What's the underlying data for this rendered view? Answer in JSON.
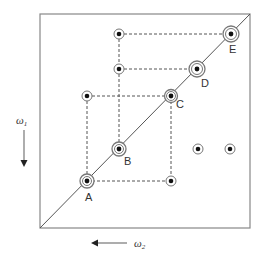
{
  "diagram": {
    "type": "2D spectrum correlation map",
    "frame": {
      "x1": 40,
      "y1": 14,
      "x2": 250,
      "y2": 228,
      "stroke": "#888888"
    },
    "diagonal": {
      "x1": 40,
      "y1": 228,
      "x2": 250,
      "y2": 14,
      "stroke": "#555555"
    },
    "axes": {
      "vertical": {
        "label": "ω",
        "subscript": "1",
        "arrow": "down"
      },
      "horizontal": {
        "label": "ω",
        "subscript": "2",
        "arrow": "left"
      }
    },
    "diagonal_peaks": [
      {
        "id": "A",
        "label": "A",
        "x": 87,
        "y": 181,
        "lx": 85,
        "ly": 201
      },
      {
        "id": "B",
        "label": "B",
        "x": 119,
        "y": 149,
        "lx": 124,
        "ly": 165
      },
      {
        "id": "C",
        "label": "C",
        "x": 171,
        "y": 96,
        "lx": 176,
        "ly": 108
      },
      {
        "id": "D",
        "label": "D",
        "x": 197,
        "y": 69,
        "lx": 201,
        "ly": 87
      },
      {
        "id": "E",
        "label": "E",
        "x": 231,
        "y": 34,
        "lx": 229,
        "ly": 53
      }
    ],
    "cross_peaks": [
      {
        "x": 87,
        "y": 96
      },
      {
        "x": 119,
        "y": 69
      },
      {
        "x": 119,
        "y": 34
      },
      {
        "x": 171,
        "y": 181
      },
      {
        "x": 198,
        "y": 149
      },
      {
        "x": 230,
        "y": 149
      }
    ],
    "dashed_connections": [
      {
        "x1": 87,
        "y1": 96,
        "x2": 171,
        "y2": 96
      },
      {
        "x1": 87,
        "y1": 96,
        "x2": 87,
        "y2": 181
      },
      {
        "x1": 87,
        "y1": 181,
        "x2": 171,
        "y2": 181
      },
      {
        "x1": 171,
        "y1": 96,
        "x2": 171,
        "y2": 181
      },
      {
        "x1": 119,
        "y1": 34,
        "x2": 231,
        "y2": 34
      },
      {
        "x1": 119,
        "y1": 69,
        "x2": 197,
        "y2": 69
      },
      {
        "x1": 119,
        "y1": 34,
        "x2": 119,
        "y2": 149
      }
    ],
    "colors": {
      "dot": "#111111",
      "ring": "#777777",
      "dash": "#555555",
      "text": "#333333"
    }
  }
}
